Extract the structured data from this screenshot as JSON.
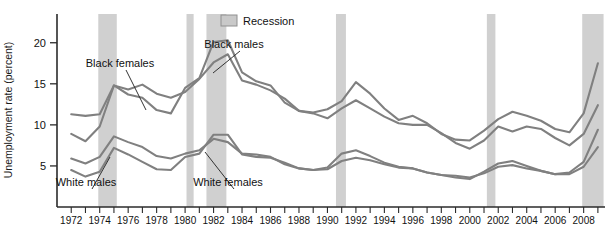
{
  "chart_data": {
    "type": "line",
    "title": "",
    "xlabel": "",
    "ylabel": "Unemployment rate (percent)",
    "ylim": [
      0,
      23.5
    ],
    "yticks": [
      5,
      10,
      15,
      20
    ],
    "xlim": [
      1971,
      2009.5
    ],
    "xticks": [
      1972,
      1973,
      1974,
      1975,
      1976,
      1977,
      1978,
      1979,
      1980,
      1981,
      1982,
      1983,
      1984,
      1985,
      1986,
      1987,
      1988,
      1989,
      1990,
      1991,
      1992,
      1993,
      1994,
      1995,
      1996,
      1997,
      1998,
      1999,
      2000,
      2001,
      2002,
      2003,
      2004,
      2005,
      2006,
      2007,
      2008,
      2009
    ],
    "xticklabels": [
      "1972",
      "1974",
      "1976",
      "1978",
      "1980",
      "1982",
      "1984",
      "1986",
      "1988",
      "1990",
      "1992",
      "1994",
      "1996",
      "1998",
      "2000",
      "2002",
      "2004",
      "2006",
      "2008"
    ],
    "xticklabel_years": [
      1972,
      1974,
      1976,
      1978,
      1980,
      1982,
      1984,
      1986,
      1988,
      1990,
      1992,
      1994,
      1996,
      1998,
      2000,
      2002,
      2004,
      2006,
      2008
    ],
    "grid": false,
    "legend": {
      "position": "top-center-right",
      "entries": [
        {
          "label": "Recession",
          "type": "band",
          "color": "#c9c9c9"
        }
      ]
    },
    "annotations": [
      {
        "label": "Black females",
        "x": 120,
        "y": 67,
        "leader_to_x": 146,
        "leader_to_y": 110
      },
      {
        "label": "Black males",
        "x": 234,
        "y": 48,
        "leader_to_x": 213,
        "leader_to_y": 73
      },
      {
        "label": "White males",
        "x": 86,
        "y": 186,
        "leader_to_x": 110,
        "leader_to_y": 157
      },
      {
        "label": "White females",
        "x": 228,
        "y": 186,
        "leader_to_x": 205,
        "leader_to_y": 152
      }
    ],
    "recession_bands": [
      {
        "start": 1973.9,
        "end": 1975.2
      },
      {
        "start": 1980.1,
        "end": 1980.6
      },
      {
        "start": 1981.5,
        "end": 1982.9
      },
      {
        "start": 1990.6,
        "end": 1991.3
      },
      {
        "start": 2001.2,
        "end": 2001.8
      },
      {
        "start": 2007.9,
        "end": 2009.4
      }
    ],
    "x": [
      1972,
      1973,
      1974,
      1975,
      1976,
      1977,
      1978,
      1979,
      1980,
      1981,
      1982,
      1983,
      1984,
      1985,
      1986,
      1987,
      1988,
      1989,
      1990,
      1991,
      1992,
      1993,
      1994,
      1995,
      1996,
      1997,
      1998,
      1999,
      2000,
      2001,
      2002,
      2003,
      2004,
      2005,
      2006,
      2007,
      2008,
      2009
    ],
    "series": [
      {
        "name": "Black males",
        "color": "#808080",
        "values": [
          8.9,
          8.0,
          9.8,
          14.8,
          13.7,
          13.3,
          11.8,
          11.4,
          14.5,
          15.7,
          20.1,
          20.3,
          16.4,
          15.3,
          14.8,
          12.7,
          11.7,
          11.5,
          11.9,
          12.9,
          15.2,
          13.8,
          12.0,
          10.6,
          11.1,
          10.2,
          8.9,
          8.2,
          8.1,
          9.3,
          10.7,
          11.6,
          11.1,
          10.5,
          9.5,
          9.1,
          11.4,
          17.5
        ]
      },
      {
        "name": "Black females",
        "color": "#808080",
        "values": [
          11.3,
          11.1,
          11.3,
          14.8,
          14.3,
          14.9,
          13.8,
          13.3,
          14.0,
          15.6,
          17.6,
          18.6,
          15.4,
          14.9,
          14.2,
          13.2,
          11.7,
          11.4,
          10.8,
          12.0,
          13.0,
          12.0,
          11.0,
          10.2,
          10.0,
          10.0,
          9.0,
          7.8,
          7.1,
          8.1,
          9.8,
          9.2,
          9.8,
          9.5,
          8.4,
          7.5,
          8.9,
          12.4
        ]
      },
      {
        "name": "White males",
        "color": "#808080",
        "values": [
          4.5,
          3.7,
          4.3,
          7.2,
          6.4,
          5.5,
          4.6,
          4.5,
          6.1,
          6.5,
          8.8,
          8.8,
          6.4,
          6.1,
          6.0,
          5.4,
          4.7,
          4.5,
          4.8,
          6.5,
          6.9,
          6.2,
          5.4,
          4.9,
          4.7,
          4.2,
          3.9,
          3.6,
          3.4,
          4.3,
          5.3,
          5.6,
          5.0,
          4.4,
          4.0,
          4.2,
          5.5,
          9.4
        ]
      },
      {
        "name": "White females",
        "color": "#808080",
        "values": [
          5.9,
          5.3,
          6.1,
          8.6,
          7.9,
          7.3,
          6.2,
          5.9,
          6.5,
          6.9,
          8.3,
          7.9,
          6.5,
          6.4,
          6.1,
          5.2,
          4.7,
          4.5,
          4.6,
          5.6,
          6.0,
          5.7,
          5.2,
          4.8,
          4.7,
          4.2,
          3.9,
          3.8,
          3.6,
          4.1,
          4.9,
          5.1,
          4.7,
          4.4,
          4.0,
          4.0,
          4.9,
          7.3
        ]
      }
    ]
  },
  "axis": {
    "y_title": "Unemployment rate (percent)",
    "y_tick_labels": [
      "20",
      "15",
      "10",
      "5"
    ]
  },
  "legend": {
    "recession_label": "Recession"
  }
}
